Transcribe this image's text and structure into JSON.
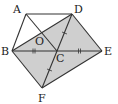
{
  "diagram": {
    "title": "",
    "points": {
      "A": {
        "label": "A",
        "x": 26,
        "y": 14,
        "lx": 13,
        "ly": 13
      },
      "D": {
        "label": "D",
        "x": 72,
        "y": 14,
        "lx": 74,
        "ly": 13
      },
      "B": {
        "label": "B",
        "x": 12,
        "y": 51,
        "lx": 1,
        "ly": 55
      },
      "C": {
        "label": "C",
        "x": 57,
        "y": 51,
        "lx": 56,
        "ly": 62
      },
      "E": {
        "label": "E",
        "x": 102,
        "y": 51,
        "lx": 104,
        "ly": 55
      },
      "F": {
        "label": "F",
        "x": 42,
        "y": 88,
        "lx": 38,
        "ly": 102
      },
      "O": {
        "label": "O",
        "x": 40,
        "y": 35,
        "lx": 35,
        "ly": 45
      }
    },
    "shaded_region": [
      "B",
      "D",
      "E",
      "F"
    ],
    "fill_color": "#cfcfcf",
    "stroke_color": "#333333",
    "segments": [
      [
        "A",
        "D"
      ],
      [
        "A",
        "B"
      ],
      [
        "A",
        "C"
      ],
      [
        "B",
        "D"
      ],
      [
        "D",
        "F"
      ],
      [
        "B",
        "E"
      ],
      [
        "D",
        "E"
      ],
      [
        "E",
        "F"
      ],
      [
        "B",
        "F"
      ]
    ],
    "equal_marks": [
      {
        "segment": [
          "B",
          "C"
        ],
        "ticks": 2
      },
      {
        "segment": [
          "C",
          "E"
        ],
        "ticks": 2
      },
      {
        "segment": [
          "D",
          "C"
        ],
        "ticks": 1
      },
      {
        "segment": [
          "C",
          "F"
        ],
        "ticks": 1
      }
    ]
  }
}
